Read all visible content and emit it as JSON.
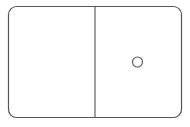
{
  "figure": {
    "stroke_color": "#555555",
    "background": "#ffffff",
    "halves": [
      {
        "side": "left",
        "pips": 0
      },
      {
        "side": "right",
        "pips": 1
      }
    ]
  }
}
